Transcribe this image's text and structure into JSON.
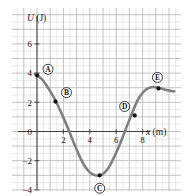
{
  "figure": {
    "kind": "potential-energy-curve",
    "background_color": "#ffffff",
    "grid": {
      "minor_color": "#dcdcdc",
      "major_color": "#b4b4b4",
      "visible": true,
      "minor_step_px": 6.6,
      "major_every": 2
    },
    "axes": {
      "axis_color": "#3c3c3c",
      "x_axis_title": "x (m)",
      "x_axis_title_italic_part": "x",
      "x_axis_title_unit_part": " (m)",
      "y_axis_title": "U (J)",
      "y_axis_title_italic_part": "U",
      "y_axis_title_unit_part": " (J)"
    },
    "curve": {
      "color": "#808080",
      "width_px": 2.6
    }
  },
  "chart_data": {
    "type": "line",
    "title": "",
    "subtitle": "",
    "xlabel": "x (m)",
    "ylabel": "U (J)",
    "xlim": [
      -1.2,
      11.3
    ],
    "ylim": [
      -4.9,
      8.6
    ],
    "grid": true,
    "legend": null,
    "x_ticks": [
      2,
      4,
      6,
      8
    ],
    "x_tick_labels": [
      "2",
      "4",
      "6",
      "8"
    ],
    "y_ticks": [
      -4,
      -2,
      0,
      2,
      4,
      6
    ],
    "y_tick_labels": [
      "-4",
      "-2",
      "0",
      "2",
      "4",
      "6"
    ],
    "series": [
      {
        "name": "U(x)",
        "color": "#808080",
        "x": [
          -0.15,
          0.0,
          0.4,
          0.8,
          1.2,
          1.6,
          2.0,
          2.4,
          2.8,
          3.2,
          3.6,
          4.0,
          4.4,
          4.8,
          5.2,
          5.6,
          6.0,
          6.4,
          6.8,
          7.2,
          7.6,
          8.0,
          8.4,
          8.8,
          9.2,
          9.6,
          10.0,
          10.4
        ],
        "y": [
          3.95,
          3.85,
          3.55,
          3.05,
          2.45,
          1.75,
          0.95,
          0.1,
          -0.8,
          -1.65,
          -2.35,
          -2.8,
          -3.0,
          -3.0,
          -2.75,
          -2.2,
          -1.45,
          -0.6,
          0.35,
          1.25,
          2.1,
          2.65,
          2.95,
          3.05,
          3.0,
          2.9,
          2.8,
          2.75
        ]
      }
    ],
    "marked_points": [
      {
        "label": "A",
        "x": 0.0,
        "y": 3.85,
        "badge_dx": 11,
        "badge_dy": -6
      },
      {
        "label": "B",
        "x": 1.4,
        "y": 2.05,
        "badge_dx": 11,
        "badge_dy": -9
      },
      {
        "label": "C",
        "x": 4.75,
        "y": -3.0,
        "badge_dx": 0,
        "badge_dy": 13
      },
      {
        "label": "D",
        "x": 7.4,
        "y": 1.1,
        "badge_dx": -10,
        "badge_dy": -9
      },
      {
        "label": "E",
        "x": 9.2,
        "y": 2.95,
        "badge_dx": -1,
        "badge_dy": -11
      }
    ]
  }
}
